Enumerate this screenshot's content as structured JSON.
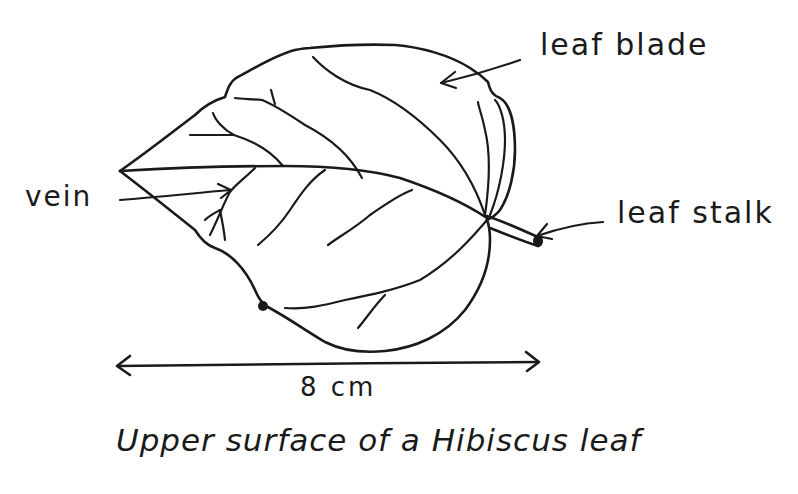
{
  "diagram": {
    "subject": "Hibiscus leaf",
    "caption": "Upper surface of a Hibiscus leaf",
    "labels": {
      "leaf_blade": "leaf blade",
      "vein": "vein",
      "leaf_stalk": "leaf stalk"
    },
    "scale_bar": {
      "label": "8 cm",
      "length_value": 8,
      "unit": "cm"
    },
    "ink_color": "#1a1a1a",
    "background_color": "#ffffff"
  }
}
